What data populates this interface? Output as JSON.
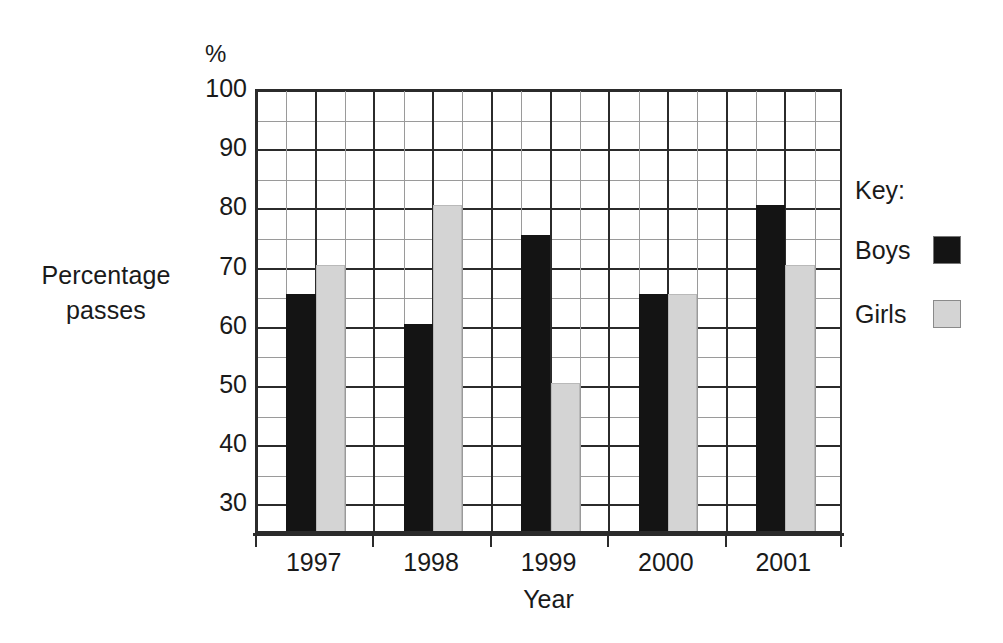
{
  "chart_data": {
    "type": "bar",
    "title": "",
    "subtitle": "",
    "xlabel": "Year",
    "ylabel": "Percentage passes",
    "unit_label": "%",
    "categories": [
      "1997",
      "1998",
      "1999",
      "2000",
      "2001"
    ],
    "series": [
      {
        "name": "Boys",
        "color": "#141414",
        "values": [
          65,
          60,
          75,
          65,
          80
        ]
      },
      {
        "name": "Girls",
        "color": "#d4d4d4",
        "values": [
          70,
          80,
          50,
          65,
          70
        ]
      }
    ],
    "ylim": [
      25,
      100
    ],
    "ytick_labels": [
      "100",
      "90",
      "80",
      "70",
      "60",
      "50",
      "40",
      "30"
    ],
    "ytick_values": [
      100,
      90,
      80,
      70,
      60,
      50,
      40,
      30
    ],
    "y_major_step": 10,
    "y_minor_step": 5,
    "grid": true,
    "legend_position": "right",
    "legend_title": "Key:"
  },
  "axis": {
    "y_title_line1": "Percentage",
    "y_title_line2": "passes",
    "x_title": "Year",
    "unit": "%"
  },
  "legend": {
    "title": "Key:",
    "items": [
      {
        "label": "Boys",
        "color": "#141414"
      },
      {
        "label": "Girls",
        "color": "#d4d4d4"
      }
    ]
  },
  "colors": {
    "boys": "#141414",
    "girls": "#d4d4d4",
    "grid_major": "#2b2b2b",
    "grid_minor": "#9a9a9a",
    "background": "#ffffff",
    "text": "#1a1a1a"
  }
}
